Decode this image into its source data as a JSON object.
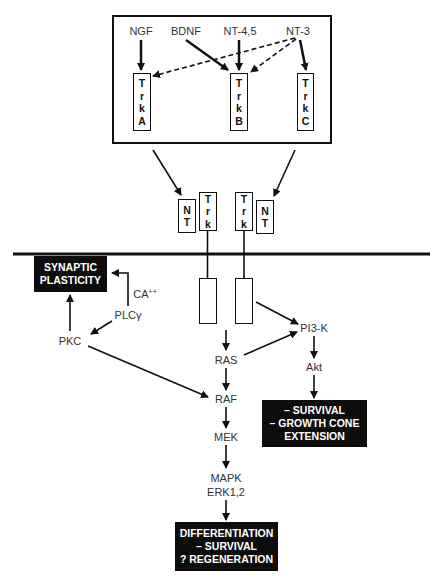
{
  "diagram": {
    "ligand_binding_panel": {
      "ligands": [
        {
          "id": "ngf",
          "label": "NGF"
        },
        {
          "id": "bdnf",
          "label": "BDNF"
        },
        {
          "id": "nt45",
          "label": "NT-4,5"
        },
        {
          "id": "nt3",
          "label": "NT-3"
        }
      ],
      "receptors": [
        {
          "id": "trka",
          "letters": [
            "T",
            "r",
            "k",
            "A"
          ]
        },
        {
          "id": "trkb",
          "letters": [
            "T",
            "r",
            "k",
            "B"
          ]
        },
        {
          "id": "trkc",
          "letters": [
            "T",
            "r",
            "k",
            "C"
          ]
        }
      ],
      "edges": [
        {
          "from": "NGF",
          "to": "TrkA",
          "style": "solid"
        },
        {
          "from": "BDNF",
          "to": "TrkB",
          "style": "solid"
        },
        {
          "from": "NT-4,5",
          "to": "TrkB",
          "style": "solid"
        },
        {
          "from": "NT-3",
          "to": "TrkC",
          "style": "solid"
        },
        {
          "from": "NT-3",
          "to": "TrkA",
          "style": "dashed"
        },
        {
          "from": "NT-3",
          "to": "TrkB",
          "style": "dashed"
        }
      ]
    },
    "dimer": {
      "nt_left": [
        "N",
        "T"
      ],
      "trk_left": [
        "T",
        "r",
        "k"
      ],
      "trk_right": [
        "T",
        "r",
        "k"
      ],
      "nt_right": [
        "N",
        "T"
      ]
    },
    "nodes": {
      "ca": "CA",
      "ca_sup": "++",
      "plc": "PLCγ",
      "pkc": "PKC",
      "ras": "RAS",
      "raf": "RAF",
      "mek": "MEK",
      "mapk": "MAPK",
      "erk": "ERK1,2",
      "pi3k": "PI3-K",
      "akt": "Akt"
    },
    "outcomes": {
      "synaptic": [
        "SYNAPTIC",
        "PLASTICITY"
      ],
      "survival": [
        "– SURVIVAL",
        "– GROWTH CONE",
        "EXTENSION"
      ],
      "differentiation": [
        "DIFFERENTIATION",
        "– SURVIVAL",
        "? REGENERATION"
      ]
    },
    "pathway_edges": [
      {
        "from": "Trk",
        "to": "PI3-K"
      },
      {
        "from": "Trk",
        "to": "RAS"
      },
      {
        "from": "RAS",
        "to": "PI3-K"
      },
      {
        "from": "RAS",
        "to": "RAF"
      },
      {
        "from": "PKC",
        "to": "RAF"
      },
      {
        "from": "RAF",
        "to": "MEK"
      },
      {
        "from": "MEK",
        "to": "MAPK ERK1,2"
      },
      {
        "from": "MAPK ERK1,2",
        "to": "DIFFERENTIATION / SURVIVAL / ? REGENERATION"
      },
      {
        "from": "PI3-K",
        "to": "Akt"
      },
      {
        "from": "Akt",
        "to": "SURVIVAL / GROWTH CONE EXTENSION"
      },
      {
        "from": "PLCγ",
        "to": "PKC"
      },
      {
        "from": "PLCγ",
        "to": "SYNAPTIC PLASTICITY",
        "via": "CA++"
      },
      {
        "from": "PKC",
        "to": "SYNAPTIC PLASTICITY"
      }
    ],
    "colors": {
      "ink": "#111111",
      "outcome_bg": "#0d0d0d",
      "outcome_text": "#ffffff"
    }
  }
}
